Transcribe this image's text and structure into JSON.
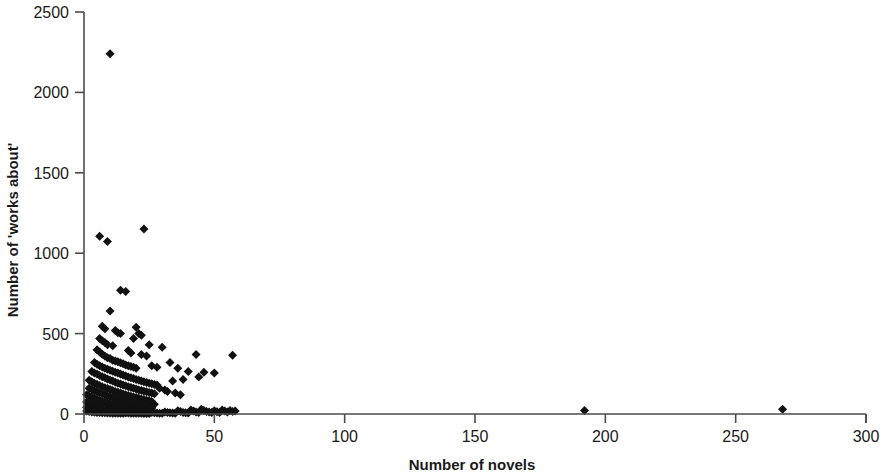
{
  "chart_data": {
    "type": "scatter",
    "title": "",
    "subtitle": "",
    "xlabel": "Number of novels",
    "ylabel": "Number of 'works about'",
    "xlim": [
      0,
      300
    ],
    "ylim": [
      0,
      2500
    ],
    "xticks": [
      0,
      50,
      100,
      150,
      200,
      250,
      300
    ],
    "yticks": [
      0,
      500,
      1000,
      1500,
      2000,
      2500
    ],
    "xtick_labels": [
      "0",
      "50",
      "100",
      "150",
      "200",
      "250",
      "300"
    ],
    "ytick_labels": [
      "0",
      "500",
      "1000",
      "1500",
      "2000",
      "2500"
    ],
    "grid": false,
    "legend": false,
    "legend_position": "none",
    "marker_shape": "diamond",
    "marker_color": "#111111",
    "marker_size": 9,
    "annotations": [],
    "series": [
      {
        "name": "Authors",
        "points": [
          [
            10,
            2240
          ],
          [
            6,
            1105
          ],
          [
            9,
            1072
          ],
          [
            23,
            1150
          ],
          [
            14,
            770
          ],
          [
            16,
            762
          ],
          [
            10,
            640
          ],
          [
            7,
            545
          ],
          [
            8,
            530
          ],
          [
            12,
            520
          ],
          [
            13,
            505
          ],
          [
            14,
            500
          ],
          [
            20,
            540
          ],
          [
            21,
            500
          ],
          [
            22,
            490
          ],
          [
            19,
            470
          ],
          [
            6,
            470
          ],
          [
            7,
            455
          ],
          [
            8,
            445
          ],
          [
            9,
            430
          ],
          [
            11,
            425
          ],
          [
            25,
            430
          ],
          [
            30,
            415
          ],
          [
            43,
            370
          ],
          [
            57,
            365
          ],
          [
            17,
            395
          ],
          [
            18,
            380
          ],
          [
            22,
            370
          ],
          [
            24,
            360
          ],
          [
            5,
            400
          ],
          [
            6,
            385
          ],
          [
            7,
            372
          ],
          [
            8,
            360
          ],
          [
            9,
            350
          ],
          [
            10,
            345
          ],
          [
            11,
            335
          ],
          [
            12,
            330
          ],
          [
            13,
            325
          ],
          [
            14,
            318
          ],
          [
            15,
            312
          ],
          [
            16,
            305
          ],
          [
            17,
            300
          ],
          [
            18,
            295
          ],
          [
            19,
            290
          ],
          [
            20,
            285
          ],
          [
            26,
            300
          ],
          [
            28,
            290
          ],
          [
            33,
            320
          ],
          [
            36,
            285
          ],
          [
            40,
            265
          ],
          [
            46,
            260
          ],
          [
            50,
            255
          ],
          [
            44,
            230
          ],
          [
            38,
            215
          ],
          [
            34,
            205
          ],
          [
            4,
            320
          ],
          [
            5,
            310
          ],
          [
            6,
            300
          ],
          [
            7,
            292
          ],
          [
            8,
            285
          ],
          [
            9,
            278
          ],
          [
            10,
            272
          ],
          [
            11,
            266
          ],
          [
            12,
            260
          ],
          [
            13,
            255
          ],
          [
            14,
            248
          ],
          [
            15,
            242
          ],
          [
            16,
            236
          ],
          [
            17,
            230
          ],
          [
            18,
            225
          ],
          [
            19,
            220
          ],
          [
            20,
            215
          ],
          [
            21,
            210
          ],
          [
            22,
            205
          ],
          [
            23,
            200
          ],
          [
            24,
            196
          ],
          [
            25,
            192
          ],
          [
            26,
            188
          ],
          [
            27,
            184
          ],
          [
            28,
            180
          ],
          [
            3,
            265
          ],
          [
            4,
            255
          ],
          [
            5,
            248
          ],
          [
            6,
            240
          ],
          [
            7,
            232
          ],
          [
            8,
            225
          ],
          [
            9,
            218
          ],
          [
            10,
            212
          ],
          [
            11,
            205
          ],
          [
            12,
            198
          ],
          [
            13,
            192
          ],
          [
            14,
            186
          ],
          [
            15,
            180
          ],
          [
            16,
            175
          ],
          [
            17,
            170
          ],
          [
            18,
            165
          ],
          [
            19,
            160
          ],
          [
            20,
            155
          ],
          [
            21,
            150
          ],
          [
            22,
            146
          ],
          [
            23,
            142
          ],
          [
            24,
            138
          ],
          [
            25,
            134
          ],
          [
            26,
            130
          ],
          [
            27,
            126
          ],
          [
            29,
            160
          ],
          [
            31,
            150
          ],
          [
            32,
            140
          ],
          [
            35,
            130
          ],
          [
            37,
            120
          ],
          [
            2,
            210
          ],
          [
            3,
            200
          ],
          [
            4,
            192
          ],
          [
            5,
            185
          ],
          [
            6,
            178
          ],
          [
            7,
            170
          ],
          [
            8,
            164
          ],
          [
            9,
            158
          ],
          [
            10,
            152
          ],
          [
            11,
            146
          ],
          [
            12,
            140
          ],
          [
            13,
            135
          ],
          [
            14,
            130
          ],
          [
            15,
            125
          ],
          [
            16,
            120
          ],
          [
            17,
            115
          ],
          [
            18,
            110
          ],
          [
            19,
            106
          ],
          [
            20,
            102
          ],
          [
            21,
            98
          ],
          [
            22,
            94
          ],
          [
            23,
            90
          ],
          [
            24,
            86
          ],
          [
            25,
            82
          ],
          [
            26,
            78
          ],
          [
            2,
            160
          ],
          [
            3,
            152
          ],
          [
            4,
            145
          ],
          [
            5,
            138
          ],
          [
            6,
            132
          ],
          [
            7,
            126
          ],
          [
            8,
            120
          ],
          [
            9,
            114
          ],
          [
            10,
            108
          ],
          [
            11,
            103
          ],
          [
            12,
            98
          ],
          [
            13,
            93
          ],
          [
            14,
            88
          ],
          [
            15,
            84
          ],
          [
            16,
            80
          ],
          [
            17,
            76
          ],
          [
            18,
            72
          ],
          [
            19,
            68
          ],
          [
            20,
            64
          ],
          [
            21,
            60
          ],
          [
            22,
            57
          ],
          [
            23,
            54
          ],
          [
            24,
            51
          ],
          [
            25,
            48
          ],
          [
            27,
            60
          ],
          [
            1,
            120
          ],
          [
            2,
            112
          ],
          [
            3,
            105
          ],
          [
            4,
            98
          ],
          [
            5,
            92
          ],
          [
            6,
            86
          ],
          [
            7,
            80
          ],
          [
            8,
            75
          ],
          [
            9,
            70
          ],
          [
            10,
            66
          ],
          [
            11,
            62
          ],
          [
            12,
            58
          ],
          [
            13,
            54
          ],
          [
            14,
            50
          ],
          [
            15,
            47
          ],
          [
            16,
            44
          ],
          [
            17,
            41
          ],
          [
            18,
            38
          ],
          [
            19,
            35
          ],
          [
            20,
            33
          ],
          [
            21,
            31
          ],
          [
            22,
            29
          ],
          [
            23,
            27
          ],
          [
            24,
            25
          ],
          [
            26,
            38
          ],
          [
            1,
            75
          ],
          [
            2,
            68
          ],
          [
            3,
            62
          ],
          [
            4,
            56
          ],
          [
            5,
            50
          ],
          [
            6,
            45
          ],
          [
            7,
            41
          ],
          [
            8,
            37
          ],
          [
            9,
            34
          ],
          [
            10,
            31
          ],
          [
            11,
            28
          ],
          [
            12,
            26
          ],
          [
            13,
            24
          ],
          [
            14,
            22
          ],
          [
            15,
            20
          ],
          [
            16,
            19
          ],
          [
            17,
            18
          ],
          [
            18,
            17
          ],
          [
            19,
            16
          ],
          [
            20,
            15
          ],
          [
            1,
            40
          ],
          [
            2,
            35
          ],
          [
            3,
            30
          ],
          [
            4,
            26
          ],
          [
            5,
            23
          ],
          [
            6,
            20
          ],
          [
            7,
            18
          ],
          [
            8,
            16
          ],
          [
            9,
            14
          ],
          [
            10,
            13
          ],
          [
            11,
            12
          ],
          [
            12,
            11
          ],
          [
            13,
            10
          ],
          [
            14,
            9
          ],
          [
            15,
            8
          ],
          [
            1,
            18
          ],
          [
            2,
            15
          ],
          [
            3,
            13
          ],
          [
            4,
            11
          ],
          [
            5,
            10
          ],
          [
            6,
            9
          ],
          [
            7,
            8
          ],
          [
            8,
            7
          ],
          [
            9,
            6
          ],
          [
            10,
            6
          ],
          [
            11,
            5
          ],
          [
            12,
            5
          ],
          [
            13,
            5
          ],
          [
            14,
            4
          ],
          [
            15,
            4
          ],
          [
            16,
            6
          ],
          [
            17,
            6
          ],
          [
            18,
            5
          ],
          [
            19,
            5
          ],
          [
            20,
            4
          ],
          [
            21,
            4
          ],
          [
            22,
            4
          ],
          [
            23,
            3
          ],
          [
            24,
            3
          ],
          [
            25,
            3
          ],
          [
            26,
            10
          ],
          [
            27,
            8
          ],
          [
            28,
            6
          ],
          [
            29,
            5
          ],
          [
            30,
            4
          ],
          [
            31,
            12
          ],
          [
            32,
            10
          ],
          [
            33,
            8
          ],
          [
            34,
            6
          ],
          [
            35,
            5
          ],
          [
            36,
            20
          ],
          [
            37,
            15
          ],
          [
            38,
            10
          ],
          [
            39,
            8
          ],
          [
            40,
            6
          ],
          [
            41,
            25
          ],
          [
            42,
            18
          ],
          [
            43,
            12
          ],
          [
            44,
            9
          ],
          [
            45,
            30
          ],
          [
            46,
            22
          ],
          [
            47,
            16
          ],
          [
            48,
            12
          ],
          [
            49,
            9
          ],
          [
            50,
            20
          ],
          [
            51,
            14
          ],
          [
            52,
            10
          ],
          [
            53,
            25
          ],
          [
            54,
            18
          ],
          [
            55,
            12
          ],
          [
            56,
            22
          ],
          [
            57,
            15
          ],
          [
            58,
            18
          ],
          [
            192,
            22
          ],
          [
            268,
            30
          ]
        ]
      }
    ]
  },
  "axes": {
    "x_title": "Number of novels",
    "y_title": "Number of 'works about'"
  },
  "geometry": {
    "x0_px": 84,
    "x300_px": 866,
    "y0_px": 414,
    "y2500_px": 12
  }
}
